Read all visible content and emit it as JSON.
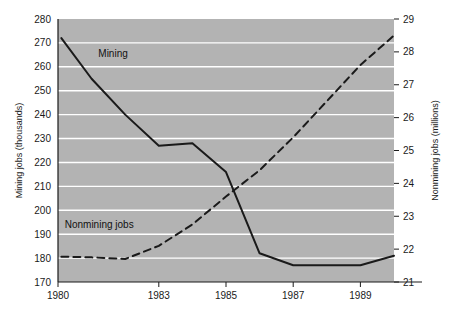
{
  "chart_data": {
    "type": "line",
    "title": "",
    "xlabel": "",
    "ylabel": "Mining jobs (thousands)",
    "y2label": "Nonmining jobs (millions)",
    "grid": true,
    "legend_position": "inline-annotations",
    "background": "#b3b3b3",
    "gridline_color": "#ffffff",
    "line_color": "#1a1a1a",
    "xlim": [
      1980,
      1990
    ],
    "x_ticks": [
      1980,
      1983,
      1985,
      1987,
      1989
    ],
    "x_tick_labels": [
      "1980",
      "1983",
      "1985",
      "1987",
      "1989"
    ],
    "ylim": [
      170,
      280
    ],
    "y_ticks": [
      170,
      180,
      190,
      200,
      210,
      220,
      230,
      240,
      250,
      260,
      270,
      280
    ],
    "y_tick_labels": [
      "170",
      "180",
      "190",
      "200",
      "210",
      "220",
      "230",
      "240",
      "250",
      "260",
      "270",
      "280"
    ],
    "y2lim": [
      21,
      29
    ],
    "y2_ticks": [
      21,
      22,
      23,
      24,
      25,
      26,
      27,
      28,
      29
    ],
    "y2_tick_labels": [
      "21",
      "22",
      "23",
      "24",
      "25",
      "26",
      "27",
      "28",
      "29"
    ],
    "x": [
      1980.1,
      1981,
      1982,
      1983,
      1984,
      1985,
      1986,
      1987,
      1988,
      1989,
      1990
    ],
    "series": [
      {
        "name": "Mining",
        "axis": "left",
        "style": "solid",
        "label_text": "Mining",
        "label_x": 1981.2,
        "label_y": 264,
        "values": [
          272,
          255,
          240,
          227,
          228,
          216,
          182,
          177,
          177,
          177,
          181
        ]
      },
      {
        "name": "Nonmining jobs",
        "axis": "right",
        "style": "dashed",
        "label_text": "Nonmining jobs",
        "label_x": 1980.2,
        "label_y": 192.5,
        "values": [
          21.77,
          21.75,
          21.7,
          22.1,
          22.75,
          23.6,
          24.4,
          25.4,
          26.5,
          27.6,
          28.5
        ]
      }
    ]
  }
}
